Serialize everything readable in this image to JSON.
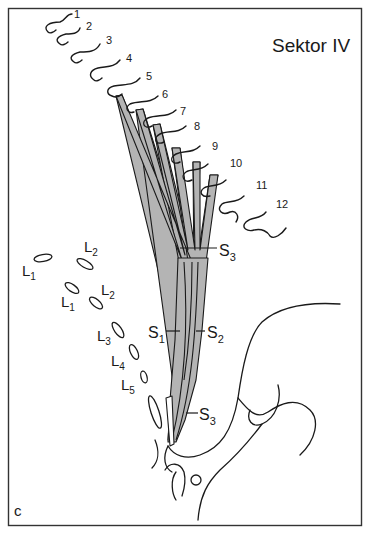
{
  "figure": {
    "title": "Sektor IV",
    "panel_letter": "c",
    "colors": {
      "ink": "#1a1a1a",
      "fill": "#b4b4b4",
      "background": "#ffffff"
    },
    "row_labels": [
      "1",
      "2",
      "3",
      "4",
      "5",
      "6",
      "7",
      "8",
      "9",
      "10",
      "11",
      "12"
    ],
    "sacral_labels": {
      "s3_top": {
        "main": "S",
        "sub": "3"
      },
      "s1": {
        "main": "S",
        "sub": "1"
      },
      "s2": {
        "main": "S",
        "sub": "2"
      },
      "s3_bottom": {
        "main": "S",
        "sub": "3"
      }
    },
    "lumbar_labels": [
      {
        "main": "L",
        "sub": "1"
      },
      {
        "main": "L",
        "sub": "2"
      },
      {
        "main": "L",
        "sub": "1"
      },
      {
        "main": "L",
        "sub": "2"
      },
      {
        "main": "L",
        "sub": "3"
      },
      {
        "main": "L",
        "sub": "4"
      },
      {
        "main": "L",
        "sub": "5"
      }
    ]
  }
}
